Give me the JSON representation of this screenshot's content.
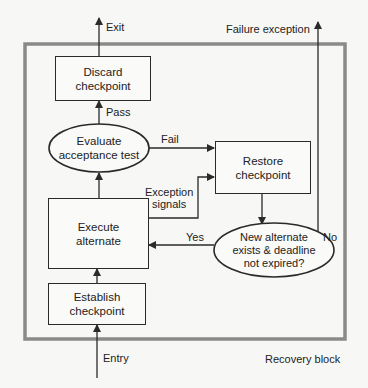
{
  "diagram": {
    "title": "Recovery block",
    "frame_color": "#8a8a8a",
    "line_color": "#2a2a2a",
    "nodes": {
      "discard": {
        "label_line1": "Discard",
        "label_line2": "checkpoint",
        "shape": "rectangle"
      },
      "evaluate": {
        "label_line1": "Evaluate",
        "label_line2": "acceptance test",
        "shape": "ellipse"
      },
      "restore": {
        "label_line1": "Restore",
        "label_line2": "checkpoint",
        "shape": "rectangle"
      },
      "execute": {
        "label_line1": "Execute",
        "label_line2": "alternate",
        "shape": "rectangle"
      },
      "decision": {
        "label_line1": "New alternate",
        "label_line2": "exists & deadline",
        "label_line3": "not expired?",
        "shape": "ellipse"
      },
      "establish": {
        "label_line1": "Establish",
        "label_line2": "checkpoint",
        "shape": "rectangle"
      }
    },
    "edges": {
      "exit": "Exit",
      "pass": "Pass",
      "fail": "Fail",
      "exception_line1": "Exception",
      "exception_line2": "signals",
      "yes": "Yes",
      "no": "No",
      "failure": "Failure exception",
      "entry": "Entry"
    },
    "container_label": "Recovery block"
  }
}
